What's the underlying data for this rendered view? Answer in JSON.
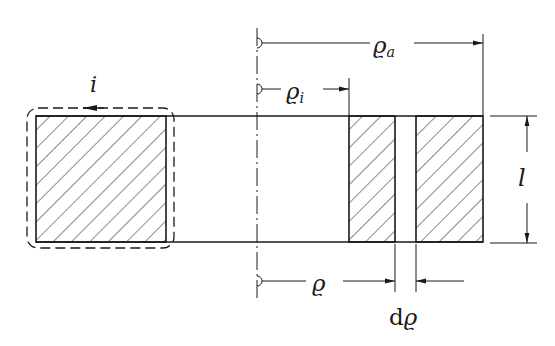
{
  "diagram": {
    "type": "technical-cross-section",
    "colors": {
      "stroke": "#1a1a1a",
      "background": "#ffffff"
    },
    "labels": {
      "current": "i",
      "outer_radius_symbol": "ϱ",
      "outer_radius_sub": "a",
      "inner_radius_symbol": "ϱ",
      "inner_radius_sub": "i",
      "radius": "ϱ",
      "length": "l",
      "ring_element_d": "d",
      "ring_element_rho": "ϱ"
    },
    "elements": {
      "left_section": "hatched square cross-section enclosed by dashed current path with arrow",
      "centerline": "dash-dot axis of symmetry",
      "right_section": "hatched cross-section split by thin ring element of width dϱ",
      "dimensions": [
        "ϱa (outer radius)",
        "ϱi (inner radius)",
        "ϱ (element radius)",
        "dϱ (element width)",
        "l (axial length)"
      ]
    }
  }
}
